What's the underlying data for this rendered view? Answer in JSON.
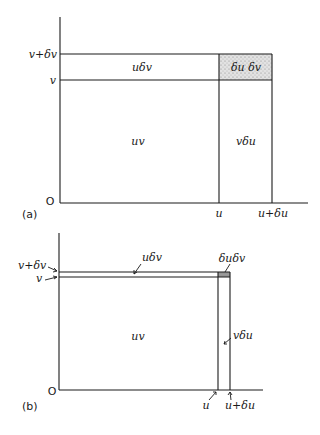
{
  "figure_a": {
    "panel_label": "(a)",
    "origin": "O",
    "x_ticks": {
      "u": "u",
      "u_du": "u+δu"
    },
    "y_ticks": {
      "v": "v",
      "v_dv": "v+δv"
    },
    "regions": {
      "main": "uv",
      "top_strip": "uδv",
      "right_strip": "vδu",
      "corner": "δu δv"
    },
    "corner_fill": "#d8d8d8"
  },
  "figure_b": {
    "panel_label": "(b)",
    "origin": "O",
    "x_ticks": {
      "u": "u",
      "u_du": "u+δu"
    },
    "y_ticks": {
      "v": "v",
      "v_dv": "v+δv"
    },
    "regions": {
      "main": "uv",
      "top_strip": "uδv",
      "right_strip": "vδu",
      "corner": "δuδv"
    },
    "corner_fill": "#9a9a9a"
  }
}
